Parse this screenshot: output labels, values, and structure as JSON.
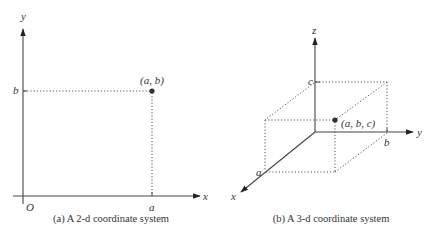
{
  "figures": [
    {
      "id": "a",
      "caption": "(a) A 2-d coordinate system",
      "axes": {
        "x_label": "x",
        "y_label": "y",
        "origin_label": "O"
      },
      "ticks": {
        "x_tick": "a",
        "y_tick": "b"
      },
      "point": {
        "label": "(a, b)",
        "coords": [
          "a",
          "b"
        ]
      }
    },
    {
      "id": "b",
      "caption": "(b) A 3-d coordinate system",
      "axes": {
        "x_label": "x",
        "y_label": "y",
        "z_label": "z"
      },
      "ticks": {
        "x_tick": "a",
        "y_tick": "b",
        "z_tick": "c"
      },
      "point": {
        "label": "(a, b, c)",
        "coords": [
          "a",
          "b",
          "c"
        ]
      }
    }
  ],
  "colors": {
    "ink": "#333333",
    "background": "#ffffff"
  }
}
